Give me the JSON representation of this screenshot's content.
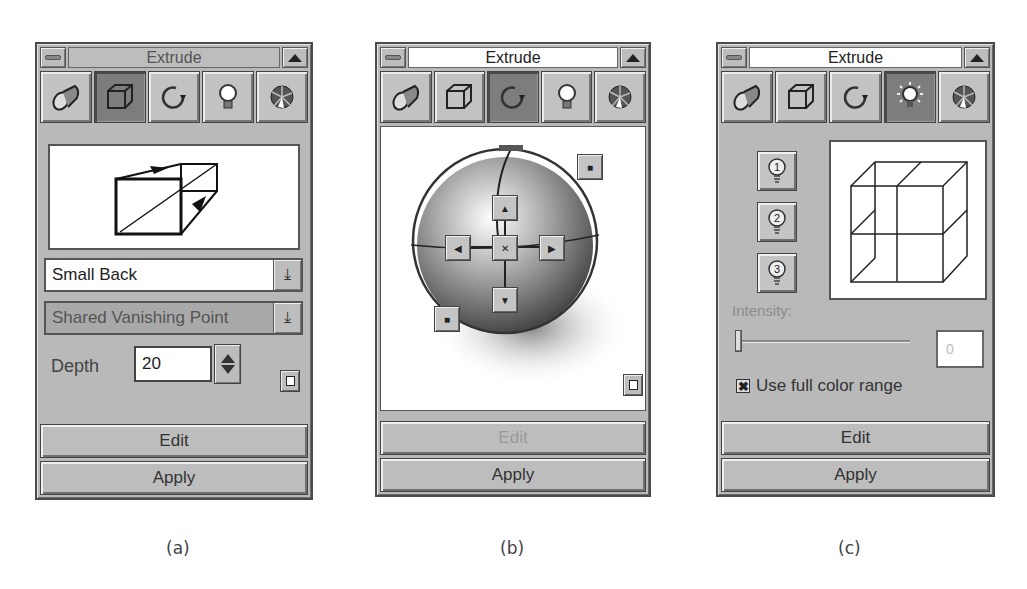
{
  "panels": {
    "a": {
      "title": "Extrude",
      "active_tab": "depth",
      "tabs": [
        {
          "name": "presets",
          "icon": "flashlight-icon"
        },
        {
          "name": "depth",
          "icon": "cube-icon"
        },
        {
          "name": "rotation",
          "icon": "rotate-icon"
        },
        {
          "name": "lighting",
          "icon": "lightbulb-icon"
        },
        {
          "name": "color",
          "icon": "color-wheel-icon"
        }
      ],
      "extrude_type": "Small Back",
      "vanishing_point": "Shared Vanishing Point",
      "depth_label": "Depth",
      "depth_value": "20",
      "edit_label": "Edit",
      "apply_label": "Apply",
      "caption": "(a)"
    },
    "b": {
      "title": "Extrude",
      "active_tab": "rotation",
      "rotation_controls": {
        "center": "✕",
        "up": "▲",
        "down": "▼",
        "left": "◀",
        "right": "▶",
        "rotate_cw": "■",
        "rotate_ccw": "■"
      },
      "edit_label": "Edit",
      "edit_disabled": true,
      "apply_label": "Apply",
      "caption": "(b)"
    },
    "c": {
      "title": "Extrude",
      "active_tab": "lighting",
      "lights": [
        "1",
        "2",
        "3"
      ],
      "intensity_label": "Intensity:",
      "intensity_value": "0",
      "use_full_color_label": "Use full color range",
      "use_full_color_checked": true,
      "edit_label": "Edit",
      "apply_label": "Apply",
      "caption": "(c)"
    }
  },
  "colors": {
    "panel_bg": "#b9b9b9",
    "active_tab": "#7d7d7d",
    "border": "#4a4a4a",
    "disabled_text": "#9a9a9a"
  }
}
